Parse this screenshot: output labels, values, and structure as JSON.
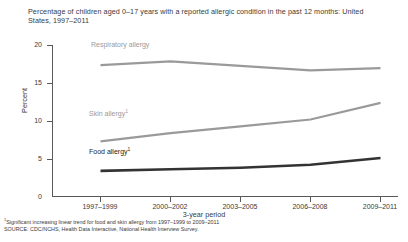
{
  "chart_data": {
    "type": "line",
    "title": "Percentage of children aged 0–17 years with a reported allergic condition in the past 12 months: United States, 1997–2011",
    "xlabel": "3-year period",
    "ylabel": "Percent",
    "categories": [
      "1997–1999",
      "2000–2002",
      "2003–2005",
      "2006–2008",
      "2009–2011"
    ],
    "ylim": [
      0,
      20
    ],
    "yticks": [
      0,
      5,
      10,
      15,
      20
    ],
    "grid": false,
    "legend_position": "inline-above-series",
    "series": [
      {
        "name": "Respiratory allergy",
        "label": "Respiratory allergy",
        "footnote_marker": "",
        "color": "#9a9a9a",
        "values": [
          17.4,
          17.9,
          17.3,
          16.7,
          17.0
        ]
      },
      {
        "name": "Skin allergy",
        "label": "Skin allergy",
        "footnote_marker": "1",
        "color": "#9a9a9a",
        "values": [
          7.3,
          8.4,
          9.3,
          10.2,
          12.4
        ]
      },
      {
        "name": "Food allergy",
        "label": "Food allergy",
        "footnote_marker": "1",
        "color": "#333333",
        "values": [
          3.4,
          3.6,
          3.8,
          4.2,
          5.1
        ]
      }
    ],
    "annotations": [
      "Significant increasing linear trend for food and skin allergy from 1997–1999 to 2009–2011"
    ]
  },
  "footnotes": {
    "note1_marker": "1",
    "note1": "Significant increasing linear trend for food and skin allergy from 1997–1999 to 2009–2011",
    "source": "SOURCE: CDC/NCHS, Health Data Interactive, National Health Interview Survey."
  },
  "yticks": {
    "t0": "0",
    "t1": "5",
    "t2": "10",
    "t3": "15",
    "t4": "20"
  },
  "xticks": {
    "t0": "1997–1999",
    "t1": "2000–2002",
    "t2": "2003–2005",
    "t3": "2006–2008",
    "t4": "2009–2011"
  },
  "series_labels": {
    "respiratory": "Respiratory allergy",
    "skin": "Skin allergy",
    "food": "Food allergy"
  }
}
